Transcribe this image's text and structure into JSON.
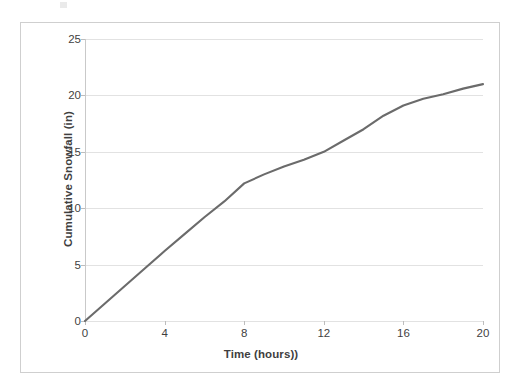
{
  "chart_data": {
    "type": "line",
    "title": "",
    "subtitle": "",
    "xlabel": "Time (hours))",
    "ylabel": "Cumulative Snowfall (in)",
    "xlim": [
      0,
      20
    ],
    "ylim": [
      0,
      25
    ],
    "xticks": [
      "0",
      "4",
      "8",
      "12",
      "16",
      "20"
    ],
    "xtick_values": [
      0,
      4,
      8,
      12,
      16,
      20
    ],
    "yticks": [
      "0",
      "5",
      "10",
      "15",
      "20",
      "25"
    ],
    "ytick_values": [
      0,
      5,
      10,
      15,
      20,
      25
    ],
    "grid": "horizontal",
    "legend": "none",
    "line_color": "#6b6b6b",
    "gridline_color": "#e2e2e2",
    "axis_color": "#c9c9c9",
    "plot_background": "#ffffff",
    "frame_border_color": "#cfcfcf",
    "text_color": "#3f3f3f",
    "series": [
      {
        "name": "Cumulative Snowfall",
        "x": [
          0,
          1,
          2,
          3,
          4,
          5,
          6,
          7,
          8,
          9,
          10,
          11,
          12,
          13,
          14,
          15,
          16,
          17,
          18,
          19,
          20
        ],
        "values": [
          0,
          1.55,
          3.1,
          4.65,
          6.2,
          7.7,
          9.2,
          10.6,
          12.2,
          13.0,
          13.7,
          14.3,
          15.0,
          16.0,
          17.0,
          18.2,
          19.1,
          19.7,
          20.1,
          20.6,
          21.0
        ]
      }
    ]
  },
  "artifacts": {
    "scan_mark_label": "scan-artifact"
  }
}
